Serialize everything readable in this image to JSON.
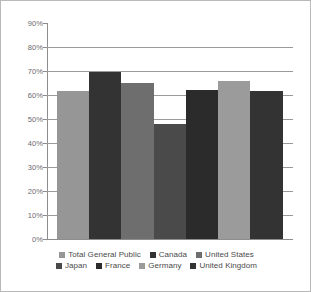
{
  "chart_data": {
    "type": "bar",
    "title": "",
    "subtitle": "",
    "xlabel": "",
    "ylabel": "",
    "categories": [
      "Total General Public",
      "Canada",
      "United States",
      "Japan",
      "France",
      "Germany",
      "United Kingdom"
    ],
    "values": [
      61.5,
      69.5,
      65,
      48,
      62,
      66,
      61.5
    ],
    "value_unit": "%",
    "ylim": [
      0,
      90
    ],
    "y_tick_values": [
      0,
      10,
      20,
      30,
      40,
      50,
      60,
      70,
      80,
      90
    ],
    "y_tick_labels": [
      "0%",
      "10%",
      "20%",
      "30%",
      "40%",
      "50%",
      "60%",
      "70%",
      "80%",
      "90%"
    ],
    "grid": true,
    "grid_axis": "y",
    "legend_position": "bottom",
    "bar_gap": 0,
    "series_colors": [
      "#969696",
      "#333333",
      "#6e6e6e",
      "#4a4a4a",
      "#2b2b2b",
      "#9b9b9b",
      "#333333"
    ]
  },
  "legend": {
    "rows": [
      [
        {
          "label": "Total General Public",
          "color": "#969696"
        },
        {
          "label": "Canada",
          "color": "#333333"
        },
        {
          "label": "United States",
          "color": "#6e6e6e"
        }
      ],
      [
        {
          "label": "Japan",
          "color": "#4a4a4a"
        },
        {
          "label": "France",
          "color": "#2b2b2b"
        },
        {
          "label": "Germany",
          "color": "#9b9b9b"
        },
        {
          "label": "United Kingdom",
          "color": "#333333"
        }
      ]
    ]
  },
  "style": {
    "background": "#ffffff",
    "border_color": "#b9b9b9",
    "gridline_color": "#9a9a9a",
    "axis_color": "#8d8d8d",
    "label_color": "#6b6b6b",
    "legend_text_color": "#4a4a4a"
  }
}
